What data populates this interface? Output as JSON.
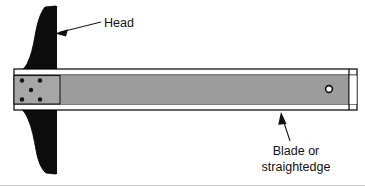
{
  "figure": {
    "background_color": "#ffffff",
    "width": 365,
    "height": 186
  },
  "labels": [
    {
      "id": "head",
      "text": "Head",
      "lines": [
        "Head"
      ],
      "text_x": 104,
      "text_y": 31,
      "anchor": "start",
      "leader": {
        "x1": 101,
        "y1": 22,
        "x2": 56,
        "y2": 33
      },
      "arrow": {
        "x": 56,
        "y": 33,
        "direction": "left"
      }
    },
    {
      "id": "blade",
      "text": "Blade or straightedge",
      "lines": [
        "Blade or",
        "straightedge"
      ],
      "text_x": 296,
      "text_y": 155,
      "anchor": "middle",
      "line_height": 16,
      "leader": {
        "x1": 290,
        "y1": 140,
        "x2": 282,
        "y2": 113
      },
      "arrow": {
        "x": 282,
        "y": 112,
        "direction": "up"
      }
    }
  ],
  "parts": {
    "head": {
      "name": "Head",
      "color": "#0d0d0d",
      "outline_color": "#000000",
      "top_y": 6,
      "bottom_y": 174,
      "straight_edge_x": 56
    },
    "blade": {
      "name": "Blade or straightedge",
      "face_color": "#9c9c9c",
      "edge_strip_color": "#ffffff",
      "outline_color": "#000000",
      "left_x": 14,
      "right_x": 357,
      "top_y": 69,
      "bottom_y": 110
    },
    "mounting_plate": {
      "name": "Mounting plate",
      "color": "#a6a6a6",
      "left_x": 14,
      "right_x": 60,
      "top_y": 74,
      "bottom_y": 105
    },
    "rivets": {
      "name": "Rivets",
      "color": "#141414",
      "radius": 2.2,
      "positions": [
        {
          "x": 22,
          "y": 79
        },
        {
          "x": 40,
          "y": 79
        },
        {
          "x": 31,
          "y": 90
        },
        {
          "x": 22,
          "y": 101
        },
        {
          "x": 40,
          "y": 101
        }
      ]
    },
    "hanging_hole": {
      "name": "Hanging hole",
      "center_x": 329,
      "center_y": 89,
      "outer_radius": 4.2,
      "inner_radius": 2.6,
      "fill_color": "#ffffff",
      "ring_color": "#111111"
    }
  }
}
